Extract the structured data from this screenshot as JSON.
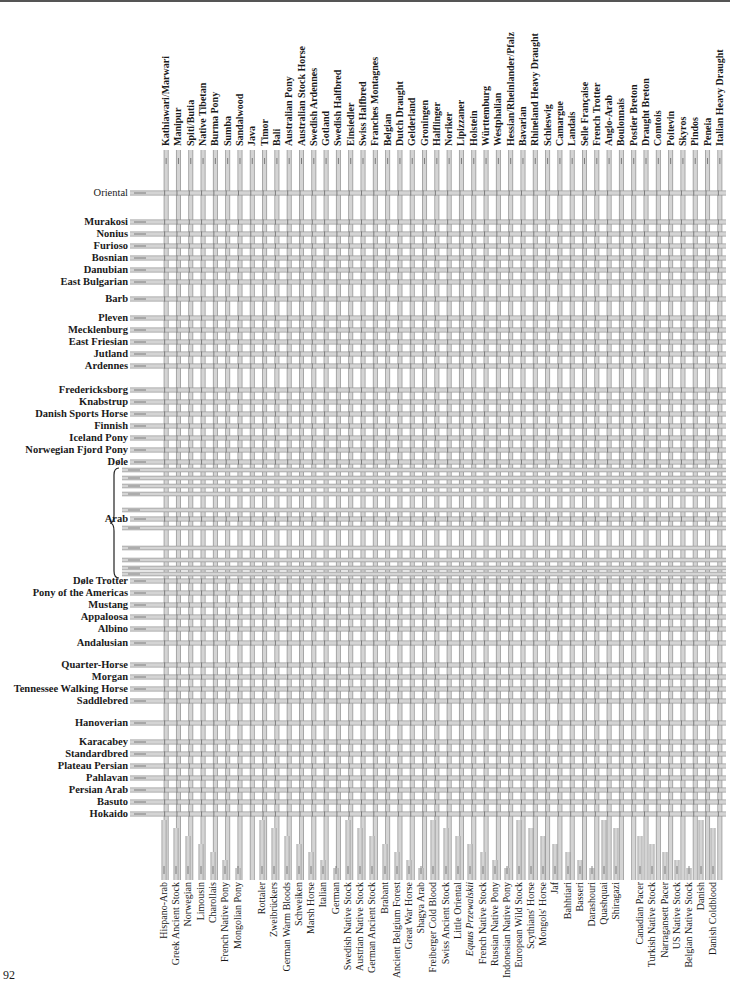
{
  "page": {
    "number": "92"
  },
  "diagram": {
    "type": "breed-genealogy-pipe-chart",
    "colors": {
      "pipe": "#d4d4d4",
      "pipe_edge": "#9a9a9a",
      "arrow": "#666666",
      "text": "#1a1a1a"
    },
    "top_breeds": [
      "Kathiawari/Marwari",
      "Manipur",
      "Spiti/Butia",
      "Native Tibetan",
      "Burma Pony",
      "Sumba",
      "Sandalwood",
      "Java",
      "Timor",
      "Bali",
      "Australian Pony",
      "Australian Stock Horse",
      "Swedish Ardennes",
      "Gotland",
      "Swedish Halfbred",
      "Einsiedler",
      "Swiss Halfbred",
      "Franches Montagnes",
      "Belgian",
      "Dutch Draught",
      "Gelderland",
      "Groningen",
      "Halflinger",
      "Noriker",
      "Lipizzaner",
      "Holstein",
      "Württemburg",
      "Westphalian",
      "Hessian/Rheinlander/Pfalz",
      "Bavarian",
      "Rhineland Heavy Draught",
      "Schleswig",
      "Camargue",
      "Landais",
      "Selle Française",
      "French Trotter",
      "Anglo-Arab",
      "Boulonnais",
      "Postier Breton",
      "Draught Breton",
      "Comtois",
      "Poitevin",
      "Skyros",
      "Pindos",
      "Peneia",
      "Italian Heavy Draught"
    ],
    "left_breeds": [
      {
        "label": "Oriental",
        "y": 193,
        "bold": false
      },
      {
        "label": "Murakosi",
        "y": 222
      },
      {
        "label": "Nonius",
        "y": 234
      },
      {
        "label": "Furioso",
        "y": 246
      },
      {
        "label": "Bosnian",
        "y": 258
      },
      {
        "label": "Danubian",
        "y": 270
      },
      {
        "label": "East Bulgarian",
        "y": 282
      },
      {
        "label": "Barb",
        "y": 299
      },
      {
        "label": "Pleven",
        "y": 318
      },
      {
        "label": "Mecklenburg",
        "y": 330
      },
      {
        "label": "East Friesian",
        "y": 342
      },
      {
        "label": "Jutland",
        "y": 354
      },
      {
        "label": "Ardennes",
        "y": 366
      },
      {
        "label": "Fredericksborg",
        "y": 390
      },
      {
        "label": "Knabstrup",
        "y": 402
      },
      {
        "label": "Danish Sports Horse",
        "y": 414
      },
      {
        "label": "Finnish",
        "y": 426
      },
      {
        "label": "Iceland Pony",
        "y": 438
      },
      {
        "label": "Norwegian Fjord Pony",
        "y": 450
      },
      {
        "label": "Døle",
        "y": 462
      },
      {
        "label": "Arab",
        "y": 519
      },
      {
        "label": "Døle Trotter",
        "y": 581
      },
      {
        "label": "Pony of the Americas",
        "y": 593
      },
      {
        "label": "Mustang",
        "y": 605
      },
      {
        "label": "Appaloosa",
        "y": 617
      },
      {
        "label": "Albino",
        "y": 629
      },
      {
        "label": "Andalusian",
        "y": 643
      },
      {
        "label": "Quarter-Horse",
        "y": 665
      },
      {
        "label": "Morgan",
        "y": 677
      },
      {
        "label": "Tennessee Walking Horse",
        "y": 689
      },
      {
        "label": "Saddlebred",
        "y": 701
      },
      {
        "label": "Hanoverian",
        "y": 723
      },
      {
        "label": "Karacabey",
        "y": 742
      },
      {
        "label": "Standardbred",
        "y": 754
      },
      {
        "label": "Plateau Persian",
        "y": 766
      },
      {
        "label": "Pahlavan",
        "y": 778
      },
      {
        "label": "Persian Arab",
        "y": 790
      },
      {
        "label": "Basuto",
        "y": 802
      },
      {
        "label": "Hokaido",
        "y": 814
      }
    ],
    "bottom_breeds": [
      {
        "label": "Hispano-Arab",
        "x": 164
      },
      {
        "label": "Greek Ancient Stock",
        "x": 176
      },
      {
        "label": "Norwegian",
        "x": 188
      },
      {
        "label": "Limousin",
        "x": 201
      },
      {
        "label": "Charollais",
        "x": 213
      },
      {
        "label": "French Native Pony",
        "x": 225
      },
      {
        "label": "Mongolian Pony",
        "x": 238
      },
      {
        "label": "Rottaler",
        "x": 262
      },
      {
        "label": "Zweibrückers",
        "x": 274
      },
      {
        "label": "German Warm Bloods",
        "x": 287
      },
      {
        "label": "Schweiken",
        "x": 299
      },
      {
        "label": "Marsh Horse",
        "x": 311
      },
      {
        "label": "Italian",
        "x": 323
      },
      {
        "label": "German",
        "x": 336
      },
      {
        "label": "Swedish Native Stock",
        "x": 348
      },
      {
        "label": "Austrian Native Stock",
        "x": 360
      },
      {
        "label": "German Ancient Stock",
        "x": 372
      },
      {
        "label": "Brabant",
        "x": 385
      },
      {
        "label": "Ancient Belgium Forest",
        "x": 397
      },
      {
        "label": "Great War Horse",
        "x": 409
      },
      {
        "label": "Shagya Arab",
        "x": 421
      },
      {
        "label": "Freiberger Cold Blood",
        "x": 433
      },
      {
        "label": "Swiss Ancient Stock",
        "x": 446
      },
      {
        "label": "Little Oriental",
        "x": 458
      },
      {
        "label": "Equus Przewalskii",
        "x": 470
      },
      {
        "label": "French Native Stock",
        "x": 483
      },
      {
        "label": "Russian Native Pony",
        "x": 495
      },
      {
        "label": "Indonesian Native Pony",
        "x": 507
      },
      {
        "label": "European Wild Stock",
        "x": 519
      },
      {
        "label": "Scythians' Horse",
        "x": 531
      },
      {
        "label": "Mongols' Horse",
        "x": 543
      },
      {
        "label": "Jaf",
        "x": 555
      },
      {
        "label": "Bahhtiari",
        "x": 568
      },
      {
        "label": "Basseri",
        "x": 580
      },
      {
        "label": "Darashouri",
        "x": 592
      },
      {
        "label": "Quashquai",
        "x": 604
      },
      {
        "label": "Shiragazi",
        "x": 616
      },
      {
        "label": "Canadian Pacer",
        "x": 640
      },
      {
        "label": "Turkish Native Stock",
        "x": 652
      },
      {
        "label": "Narragansett Pacer",
        "x": 665
      },
      {
        "label": "US Native Stock",
        "x": 677
      },
      {
        "label": "Belgian Native Stock",
        "x": 689
      },
      {
        "label": "Danish",
        "x": 701
      },
      {
        "label": "Danish Coldblood",
        "x": 713
      }
    ]
  }
}
